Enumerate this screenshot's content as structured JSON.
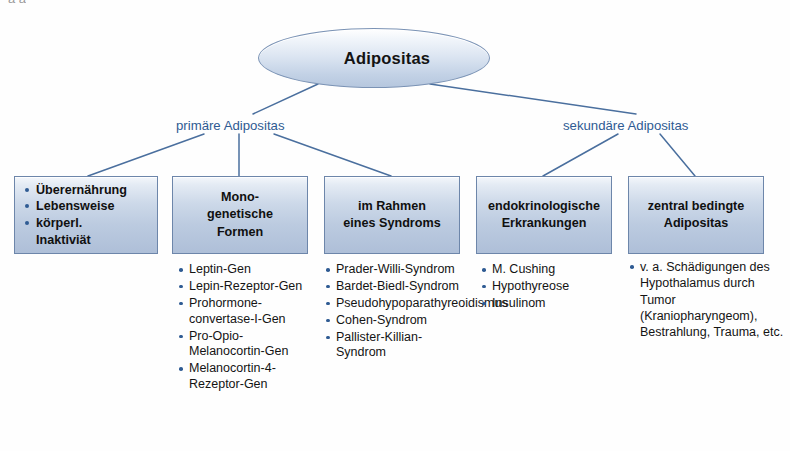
{
  "diagram": {
    "root": {
      "label": "Adipositas"
    },
    "branches": [
      {
        "id": "primary",
        "label": "primäre Adipositas"
      },
      {
        "id": "secondary",
        "label": "sekundäre Adipositas"
      }
    ],
    "categories": [
      {
        "id": "overnutrition",
        "title": "",
        "items": [
          "Überernährung",
          "Lebensweise",
          "körperl.",
          "Inaktiviät"
        ],
        "item_bulleted": [
          true,
          true,
          true,
          false
        ],
        "details": []
      },
      {
        "id": "monogenetic",
        "title": "Mono-\ngenetische\nFormen",
        "items": [],
        "details": [
          "Leptin-Gen",
          "Lepin-Rezeptor-Gen",
          "Prohormone-convertase-I-Gen",
          "Pro-Opio-Melanocortin-Gen",
          "Melanocortin-4-Rezeptor-Gen"
        ]
      },
      {
        "id": "syndrome",
        "title": "im Rahmen\neines Syndroms",
        "items": [],
        "details": [
          "Prader-Willi-Syndrom",
          "Bardet-Biedl-Syndrom",
          "Pseudohypoparathyreoidismus",
          "Cohen-Syndrom",
          "Pallister-Killian-Syndrom"
        ]
      },
      {
        "id": "endocrine",
        "title": "endokrinologische\nErkrankungen",
        "items": [],
        "details": [
          "M. Cushing",
          "Hypothyreose",
          "Insulinom"
        ]
      },
      {
        "id": "central",
        "title": "zentral bedingte\nAdipositas",
        "items": [],
        "details": [
          "v. a. Schädigungen des Hypothalamus durch Tumor (Kraniopharyngeom), Bestrahlung, Trauma, etc."
        ]
      }
    ],
    "colors": {
      "connector": "#4a6f9e",
      "branch_text": "#2f5b93",
      "bullet": "#2f5b93",
      "box_border": "#6d86aa",
      "box_fill_top": "#f4f7fb",
      "box_fill_bottom": "#aebfd8",
      "ellipse_border": "#7b93b5"
    },
    "artifacts": {
      "top_edge": "a a",
      "bottom_edge": ""
    }
  }
}
